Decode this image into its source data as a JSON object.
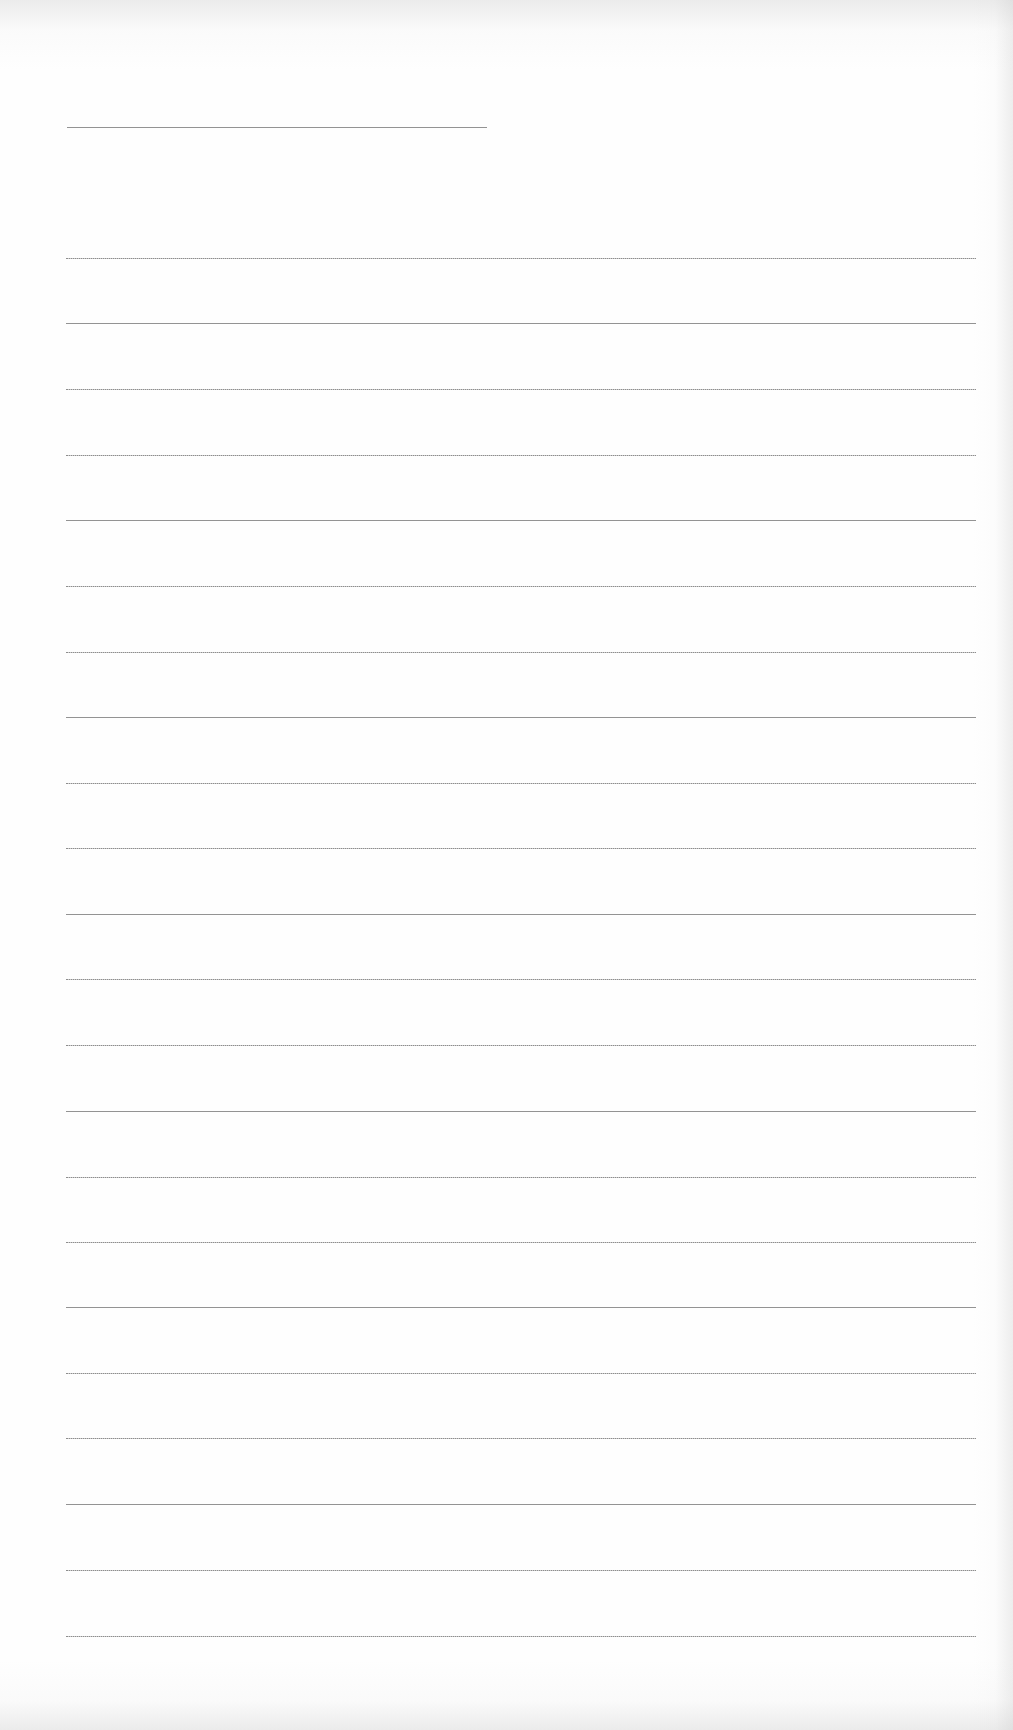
{
  "page": {
    "type": "blank lined writing paper",
    "background_color": "#fefefe",
    "rule_color": "#8e8e8e"
  },
  "header_rule": {
    "y": 127,
    "x_start": 67,
    "x_end": 487
  },
  "rules": {
    "x_start": 66,
    "x_end": 976,
    "count": 22,
    "y_positions": [
      258,
      323,
      389,
      455,
      520,
      586,
      652,
      717,
      783,
      848,
      914,
      979,
      1045,
      1111,
      1177,
      1242,
      1307,
      1373,
      1438,
      1504,
      1570,
      1636
    ]
  }
}
